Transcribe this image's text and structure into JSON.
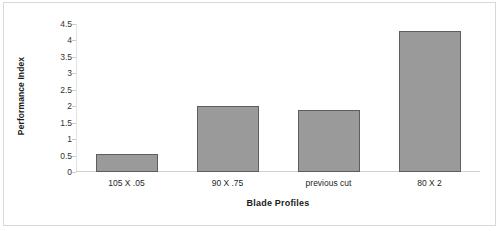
{
  "chart_data": {
    "type": "bar",
    "title": "",
    "subtitle": "",
    "categories": [
      "105 X .05",
      "90 X .75",
      "previous cut",
      "80 X 2"
    ],
    "values": [
      0.55,
      2.0,
      1.9,
      4.3
    ],
    "xlabel": "Blade Profiles",
    "ylabel": "Performance Index",
    "ylim": [
      0,
      4.5
    ],
    "ytick_labels": [
      "4.5",
      "4",
      "3.5",
      "3",
      "2.5",
      "2",
      "1.5",
      "1",
      "0.5",
      "0"
    ],
    "ytick_values": [
      4.5,
      4,
      3.5,
      3,
      2.5,
      2,
      1.5,
      1,
      0.5,
      0
    ],
    "grid": false,
    "legend": false,
    "legend_position": "none",
    "colors": {
      "bar_fill": "#9a9a9a",
      "bar_border": "#5e5e5e",
      "axis": "#cfcfcf",
      "text": "#1a1a1a",
      "frame": "#d8d8d8",
      "background": "#ffffff"
    }
  }
}
